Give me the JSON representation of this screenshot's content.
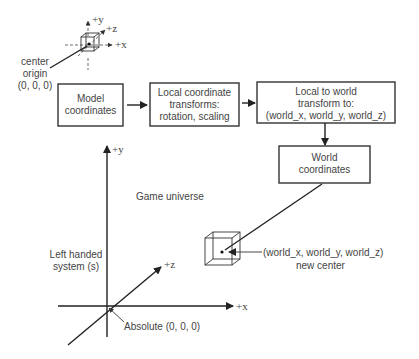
{
  "diagram": {
    "small_axes": {
      "y_label": "+y",
      "z_label": "+z",
      "x_label": "+x"
    },
    "center_origin": {
      "line1": "center",
      "line2": "origin",
      "line3": "(0, 0, 0)"
    },
    "boxes": [
      {
        "id": "model",
        "line1": "Model",
        "line2": "coordinates"
      },
      {
        "id": "local",
        "line1": "Local coordinate",
        "line2": "transforms:",
        "line3": "rotation, scaling"
      },
      {
        "id": "local-to-world",
        "line1": "Local to world",
        "line2": "transform to:",
        "line3": "(world_x, world_y, world_z)"
      },
      {
        "id": "world",
        "line1": "World",
        "line2": "coordinates"
      }
    ],
    "big_axes": {
      "y_label": "+y",
      "z_label": "+z",
      "x_label": "+x"
    },
    "game_universe": "Game universe",
    "left_handed": {
      "line1": "Left handed",
      "line2": "system (s)"
    },
    "absolute": "Absolute (0, 0, 0)",
    "new_center": {
      "line1": "(world_x, world_y, world_z)",
      "line2": "new center"
    },
    "colors": {
      "stroke": "#222222",
      "text": "#444444",
      "background": "#ffffff"
    }
  }
}
